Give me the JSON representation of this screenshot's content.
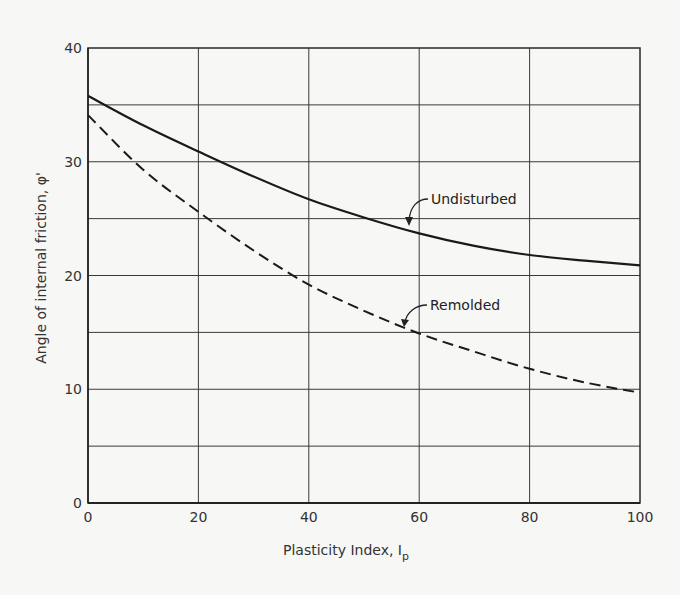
{
  "chart_data": {
    "type": "line",
    "title": "",
    "xlabel": "Plasticity Index, I_p",
    "xlabel_main": "Plasticity Index, I",
    "xlabel_sub": "p",
    "ylabel": "Angle of internal friction, φ'",
    "xlim": [
      0,
      100
    ],
    "ylim": [
      0,
      40
    ],
    "x_ticks": [
      0,
      20,
      40,
      60,
      80,
      100
    ],
    "x_tick_labels": [
      "0",
      "20",
      "40",
      "60",
      "80",
      "100"
    ],
    "y_ticks": [
      0,
      10,
      20,
      30,
      40
    ],
    "y_tick_labels": [
      "0",
      "10",
      "20",
      "30",
      "40"
    ],
    "grid": {
      "x_step": 20,
      "y_step": 5,
      "on": true
    },
    "legend": "none (inline annotations)",
    "x": [
      0,
      10,
      20,
      30,
      40,
      50,
      60,
      70,
      80,
      90,
      100
    ],
    "series": [
      {
        "name": "Undisturbed",
        "style": "solid",
        "values": [
          35.8,
          33.2,
          30.9,
          28.7,
          26.7,
          25.1,
          23.7,
          22.6,
          21.8,
          21.3,
          20.9
        ]
      },
      {
        "name": "Remolded",
        "style": "dashed",
        "values": [
          34.1,
          29.3,
          25.6,
          22.2,
          19.2,
          16.9,
          14.9,
          13.3,
          11.8,
          10.6,
          9.7
        ]
      }
    ],
    "annotations": [
      {
        "text": "Undisturbed",
        "points_to": {
          "x": 58,
          "y": 23.9
        }
      },
      {
        "text": "Remolded",
        "points_to": {
          "x": 57,
          "y": 15.4
        }
      }
    ]
  }
}
